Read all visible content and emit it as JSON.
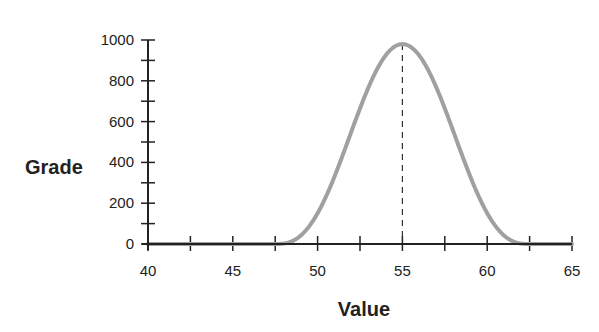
{
  "chart_data": {
    "type": "line",
    "title": "",
    "xlabel": "Value",
    "ylabel": "Grade",
    "xlim": [
      40,
      65
    ],
    "ylim": [
      0,
      1000
    ],
    "x_ticks": [
      40,
      45,
      50,
      55,
      60,
      65
    ],
    "x_minor_step": 2.5,
    "y_ticks": [
      0,
      200,
      400,
      600,
      800,
      1000
    ],
    "y_minor_step": 100,
    "grid": false,
    "legend": null,
    "series": [
      {
        "name": "Grade curve",
        "color": "#a0a0a0",
        "x": [
          40,
          45,
          47.5,
          48.5,
          49.5,
          50.5,
          51.5,
          52.5,
          53.5,
          54.5,
          55,
          55.5,
          56.5,
          57.5,
          58.5,
          59.5,
          60.5,
          61.5,
          62.5,
          65
        ],
        "values": [
          0,
          0,
          0,
          42,
          160,
          330,
          535,
          735,
          890,
          970,
          980,
          970,
          890,
          735,
          535,
          330,
          160,
          42,
          0,
          0
        ]
      }
    ],
    "annotations": [
      {
        "type": "vertical-dashed-line",
        "x": 55,
        "y_from": 0,
        "y_to": 980
      }
    ]
  }
}
